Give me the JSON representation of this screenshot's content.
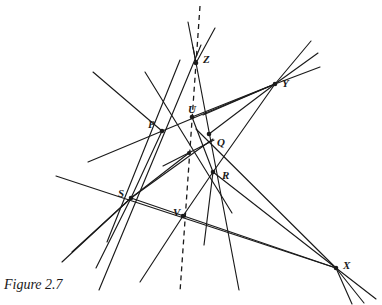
{
  "figure": {
    "caption": "Figure 2.7",
    "title": "Figure 2.7",
    "background_color": "#ffffff",
    "ink_color": "#1a1a1a"
  },
  "chart_data": {
    "type": "diagram",
    "title": "Figure 2.7",
    "xlim": [
      0,
      382
    ],
    "ylim": [
      0,
      305
    ],
    "grid": false,
    "legend": null,
    "points": [
      {
        "label": "Z",
        "x": 196,
        "y": 63,
        "label_dx": 7,
        "label_dy": -9,
        "dot": true
      },
      {
        "label": "Y",
        "x": 275,
        "y": 84,
        "label_dx": 7,
        "label_dy": 0,
        "dot": true
      },
      {
        "label": "U",
        "x": 192,
        "y": 117,
        "label_dx": -4,
        "label_dy": -13,
        "dot": true
      },
      {
        "label": "P",
        "x": 162,
        "y": 131,
        "label_dx": -14,
        "label_dy": -12,
        "dot": true
      },
      {
        "label": "Q",
        "x": 209,
        "y": 134,
        "label_dx": 8,
        "label_dy": 3,
        "dot": true
      },
      {
        "label": "R",
        "x": 213,
        "y": 172,
        "label_dx": 9,
        "label_dy": -2,
        "dot": true
      },
      {
        "label": "S",
        "x": 131,
        "y": 198,
        "label_dx": -13,
        "label_dy": -10,
        "dot": true
      },
      {
        "label": "V",
        "x": 183,
        "y": 216,
        "label_dx": -10,
        "label_dy": -9,
        "dot": true
      },
      {
        "label": "X",
        "x": 336,
        "y": 268,
        "label_dx": 7,
        "label_dy": -8,
        "dot": true
      }
    ],
    "unlabeled_nodes": [
      {
        "x": 189,
        "y": 153
      }
    ],
    "solid_lines": [
      {
        "name": "Z-through-S-down-left",
        "x1": 201,
        "y1": 45,
        "x2": 99,
        "y2": 290
      },
      {
        "name": "Z-through-R-to-lower-right",
        "x1": 193,
        "y1": 47,
        "x2": 239,
        "y2": 290
      },
      {
        "name": "Z-upper-ray-left",
        "x1": 196,
        "y1": 63,
        "x2": 188,
        "y2": 22
      },
      {
        "name": "Z-upper-ray-right",
        "x1": 196,
        "y1": 63,
        "x2": 215,
        "y2": 28
      },
      {
        "name": "P-Q-Y-extended",
        "x1": 88,
        "y1": 162,
        "x2": 275,
        "y2": 84
      },
      {
        "name": "P-to-upper-left-ray",
        "x1": 162,
        "y1": 131,
        "x2": 93,
        "y2": 72
      },
      {
        "name": "P-U-Q-R-X-pencil-upper",
        "x1": 145,
        "y1": 72,
        "x2": 232,
        "y2": 213
      },
      {
        "name": "S-P-U-Z-upper-left-ray",
        "x1": 107,
        "y1": 242,
        "x2": 180,
        "y2": 60
      },
      {
        "name": "U-to-Y-line",
        "x1": 192,
        "y1": 117,
        "x2": 275,
        "y2": 84
      },
      {
        "name": "Q-to-Y-line",
        "x1": 209,
        "y1": 134,
        "x2": 275,
        "y2": 84
      },
      {
        "name": "R-to-Y-line",
        "x1": 213,
        "y1": 172,
        "x2": 275,
        "y2": 84
      },
      {
        "name": "Y-ray-out-1",
        "x1": 275,
        "y1": 84,
        "x2": 311,
        "y2": 41
      },
      {
        "name": "Y-ray-out-2",
        "x1": 275,
        "y1": 84,
        "x2": 318,
        "y2": 53
      },
      {
        "name": "Y-ray-out-3",
        "x1": 275,
        "y1": 84,
        "x2": 320,
        "y2": 67
      },
      {
        "name": "Y-ray-left-down-1",
        "x1": 275,
        "y1": 84,
        "x2": 203,
        "y2": 115
      },
      {
        "name": "S-V-X-baseline",
        "x1": 56,
        "y1": 176,
        "x2": 336,
        "y2": 268
      },
      {
        "name": "S-to-R-to-X",
        "x1": 131,
        "y1": 198,
        "x2": 336,
        "y2": 268
      },
      {
        "name": "Q-R-to-X",
        "x1": 196,
        "y1": 129,
        "x2": 336,
        "y2": 268
      },
      {
        "name": "R-to-X-direct",
        "x1": 213,
        "y1": 172,
        "x2": 336,
        "y2": 268
      },
      {
        "name": "S-ray-down-left-1",
        "x1": 131,
        "y1": 198,
        "x2": 62,
        "y2": 262
      },
      {
        "name": "S-ray-down-left-2",
        "x1": 131,
        "y1": 198,
        "x2": 96,
        "y2": 268
      },
      {
        "name": "S-ray-down-left-3",
        "x1": 131,
        "y1": 198,
        "x2": 72,
        "y2": 252
      },
      {
        "name": "V-ray-down-left",
        "x1": 183,
        "y1": 216,
        "x2": 140,
        "y2": 282
      },
      {
        "name": "X-ray-out-1",
        "x1": 336,
        "y1": 268,
        "x2": 376,
        "y2": 299
      },
      {
        "name": "X-ray-out-2",
        "x1": 336,
        "y1": 268,
        "x2": 364,
        "y2": 303
      },
      {
        "name": "X-ray-out-3",
        "x1": 336,
        "y1": 268,
        "x2": 352,
        "y2": 304
      },
      {
        "name": "P-S-segment",
        "x1": 162,
        "y1": 131,
        "x2": 131,
        "y2": 198
      },
      {
        "name": "S-Q-segment-through-center",
        "x1": 131,
        "y1": 198,
        "x2": 213,
        "y2": 139
      },
      {
        "name": "U-V-cross-left",
        "x1": 163,
        "y1": 166,
        "x2": 214,
        "y2": 140
      },
      {
        "name": "center-to-lower-left",
        "x1": 189,
        "y1": 153,
        "x2": 131,
        "y2": 198
      },
      {
        "name": "R-V-segment",
        "x1": 213,
        "y1": 172,
        "x2": 183,
        "y2": 216
      },
      {
        "name": "R-ray-down",
        "x1": 213,
        "y1": 172,
        "x2": 204,
        "y2": 245
      },
      {
        "name": "U-Q-R-chain",
        "x1": 192,
        "y1": 117,
        "x2": 213,
        "y2": 172
      }
    ],
    "dashed_lines": [
      {
        "name": "axis-of-perspectivity",
        "x1": 200,
        "y1": 6,
        "x2": 180,
        "y2": 292,
        "dash": "5,4"
      }
    ]
  }
}
